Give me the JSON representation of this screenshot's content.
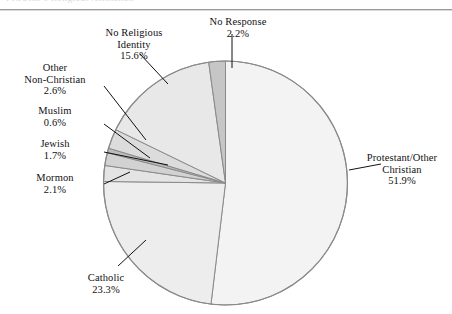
{
  "page": {
    "title_fragment": "FIGURE 6  Religious Affiliation"
  },
  "chart_data": {
    "type": "pie",
    "title": "",
    "xlabel": "",
    "ylabel": "",
    "legend_position": "none",
    "grid": false,
    "units": "percent",
    "start_angle_deg": 0,
    "direction": "clockwise",
    "categories": [
      "Protestant/Other Christian",
      "Catholic",
      "Mormon",
      "Jewish",
      "Muslim",
      "Other Non-Christian",
      "No Religious Identity",
      "No Response"
    ],
    "values": [
      51.9,
      23.3,
      2.1,
      1.7,
      0.6,
      2.6,
      15.6,
      2.2
    ],
    "slices": [
      {
        "name": "Protestant/Other Christian",
        "value": 51.9,
        "value_label": "51.9%",
        "label_line1": "Protestant/Other",
        "label_line2": "Christian",
        "color": "#f3f3f3"
      },
      {
        "name": "Catholic",
        "value": 23.3,
        "value_label": "23.3%",
        "label_line1": "Catholic",
        "label_line2": "",
        "color": "#ededed"
      },
      {
        "name": "Mormon",
        "value": 2.1,
        "value_label": "2.1%",
        "label_line1": "Mormon",
        "label_line2": "",
        "color": "#e4e4e4"
      },
      {
        "name": "Jewish",
        "value": 1.7,
        "value_label": "1.7%",
        "label_line1": "Jewish",
        "label_line2": "",
        "color": "#d2d2d2"
      },
      {
        "name": "Muslim",
        "value": 0.6,
        "value_label": "0.6%",
        "label_line1": "Muslim",
        "label_line2": "",
        "color": "#bdbdbd"
      },
      {
        "name": "Other Non-Christian",
        "value": 2.6,
        "value_label": "2.6%",
        "label_line1": "Other",
        "label_line2": "Non-Christian",
        "color": "#dcdcdc"
      },
      {
        "name": "No Religious Identity",
        "value": 15.6,
        "value_label": "15.6%",
        "label_line1": "No Religious",
        "label_line2": "Identity",
        "color": "#e8e8e8"
      },
      {
        "name": "No Response",
        "value": 2.2,
        "value_label": "2.2%",
        "label_line1": "No Response",
        "label_line2": "",
        "color": "#c6c6c6"
      }
    ],
    "total": 100.0,
    "outline_color": "#8a8a8a",
    "background_color": "#ffffff"
  }
}
